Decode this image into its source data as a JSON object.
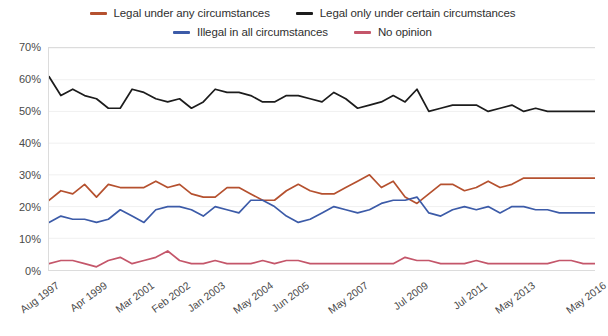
{
  "legend": {
    "rows": [
      [
        {
          "label": "Legal under any circumstances",
          "color": "#b5512f",
          "name": "legend-item-legal-any"
        },
        {
          "label": "Legal only under certain circumstances",
          "color": "#1c1c1c",
          "name": "legend-item-legal-certain"
        }
      ],
      [
        {
          "label": "Illegal in all circumstances",
          "color": "#3c5ba8",
          "name": "legend-item-illegal-all"
        },
        {
          "label": "No opinion",
          "color": "#c4566a",
          "name": "legend-item-no-opinion"
        }
      ]
    ]
  },
  "chart_data": {
    "type": "line",
    "title": "",
    "subtitle": "",
    "xlabel": "",
    "ylabel": "",
    "ylim": [
      0,
      70
    ],
    "yticks": [
      0,
      10,
      20,
      30,
      40,
      50,
      60,
      70
    ],
    "ytick_labels": [
      "0%",
      "10%",
      "20%",
      "30%",
      "40%",
      "50%",
      "60%",
      "70%"
    ],
    "grid": true,
    "legend_position": "top",
    "x_tick_labels": [
      "Aug 1997",
      "Apr 1999",
      "Mar 2001",
      "Feb 2002",
      "Jan 2003",
      "May 2004",
      "Jun 2005",
      "May 2007",
      "Jul 2009",
      "Jul 2011",
      "May 2013",
      "May 2016"
    ],
    "x_tick_indices": [
      0,
      4,
      8,
      11,
      14,
      18,
      21,
      26,
      31,
      36,
      40,
      46
    ],
    "n_points": 47,
    "series": [
      {
        "name": "Legal only under certain circumstances",
        "color": "#1c1c1c",
        "values": [
          61,
          55,
          57,
          55,
          54,
          51,
          51,
          57,
          56,
          54,
          53,
          54,
          51,
          53,
          57,
          56,
          56,
          55,
          53,
          53,
          55,
          55,
          54,
          53,
          56,
          54,
          51,
          52,
          53,
          55,
          53,
          57,
          50,
          51,
          52,
          52,
          52,
          50,
          51,
          52,
          50,
          51,
          50,
          50,
          50,
          50,
          50
        ]
      },
      {
        "name": "Legal under any circumstances",
        "color": "#b5512f",
        "values": [
          22,
          25,
          24,
          27,
          23,
          27,
          26,
          26,
          26,
          28,
          26,
          27,
          24,
          23,
          23,
          26,
          26,
          24,
          22,
          22,
          25,
          27,
          25,
          24,
          24,
          26,
          28,
          30,
          26,
          28,
          23,
          21,
          24,
          27,
          27,
          25,
          26,
          28,
          26,
          27,
          29,
          29,
          29,
          29,
          29,
          29,
          29
        ]
      },
      {
        "name": "Illegal in all circumstances",
        "color": "#3c5ba8",
        "values": [
          15,
          17,
          16,
          16,
          15,
          16,
          19,
          17,
          15,
          19,
          20,
          20,
          19,
          17,
          20,
          19,
          18,
          22,
          22,
          20,
          17,
          15,
          16,
          18,
          20,
          19,
          18,
          19,
          21,
          22,
          22,
          23,
          18,
          17,
          19,
          20,
          19,
          20,
          18,
          20,
          20,
          19,
          19,
          18,
          18,
          18,
          18
        ]
      },
      {
        "name": "No opinion",
        "color": "#c4566a",
        "values": [
          2,
          3,
          3,
          2,
          1,
          3,
          4,
          2,
          3,
          4,
          6,
          3,
          2,
          2,
          3,
          2,
          2,
          2,
          3,
          2,
          3,
          3,
          2,
          2,
          2,
          2,
          2,
          2,
          2,
          2,
          4,
          3,
          3,
          2,
          2,
          2,
          3,
          2,
          2,
          2,
          2,
          2,
          2,
          3,
          3,
          2,
          2
        ]
      }
    ]
  }
}
